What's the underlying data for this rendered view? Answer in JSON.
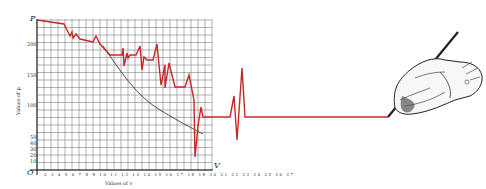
{
  "chart_data": {
    "type": "line",
    "title": "",
    "xlabel": "Values of v",
    "ylabel": "Values of p",
    "x_axis_symbol": "V",
    "y_axis_symbol": "P",
    "origin_label": "O",
    "x_ticks": [
      "2",
      "3",
      "4",
      "5",
      "6",
      "7",
      "8",
      "9",
      "10",
      "11",
      "12",
      "13",
      "14",
      "15",
      "16",
      "17",
      "18",
      "19",
      "20",
      "21",
      "22",
      "23",
      "24",
      "25",
      "26",
      "27"
    ],
    "y_ticks": [
      "10",
      "20",
      "30",
      "40",
      "50",
      "100",
      "150",
      "200"
    ],
    "grid": true,
    "series": [
      {
        "name": "measured (red)",
        "color": "#c62828",
        "x": [
          2,
          5,
          6,
          6.5,
          7,
          8,
          10,
          11,
          13,
          13.3,
          13.6,
          14,
          15,
          15.3,
          15.6,
          16,
          17,
          17.4,
          18,
          18.4,
          19,
          20,
          21,
          21.4,
          22,
          23,
          23.6,
          24,
          24.4,
          25,
          25.6
        ],
        "y": [
          240,
          230,
          205,
          213,
          210,
          200,
          195,
          178,
          178,
          160,
          185,
          178,
          190,
          160,
          175,
          165,
          205,
          100,
          170,
          140,
          140,
          160,
          130,
          110,
          130,
          100,
          40,
          115,
          80,
          80,
          80
        ]
      },
      {
        "name": "theoretical curve (black)",
        "color": "#222222",
        "x": [
          10,
          12,
          14,
          16,
          18,
          20,
          22,
          24,
          25
        ],
        "y": [
          195,
          160,
          132,
          110,
          95,
          82,
          72,
          64,
          60
        ]
      }
    ],
    "annotation": "Red line continues beyond chart into a heartbeat-like spike, then a flat line drawn by a hand holding a pen"
  },
  "labels": {
    "p": "P",
    "v": "V",
    "o": "O",
    "ytitle": "Values of p",
    "xtitle": "Values of v",
    "y200": "200",
    "y150": "150",
    "y100": "100",
    "y50": "50",
    "y40": "40",
    "y30": "30",
    "y20": "20",
    "y10": "10",
    "xticks": "2 3 4 5 6 7 8 9 10 11 12 13 14 15 16 17 18 19 20 21 22 23 24 25 26 27"
  }
}
